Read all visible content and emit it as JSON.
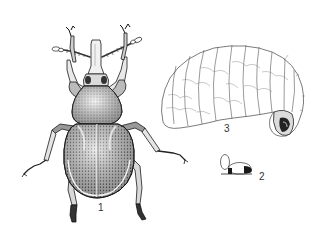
{
  "figure": {
    "labels": [
      {
        "id": "adult",
        "text": "1"
      },
      {
        "id": "eggs",
        "text": "2"
      },
      {
        "id": "larva",
        "text": "3"
      }
    ],
    "colors": {
      "background": "#ffffff",
      "ink": "#1a1a1a",
      "shade": "#6b6b6b",
      "light": "#bdbdbd"
    }
  }
}
